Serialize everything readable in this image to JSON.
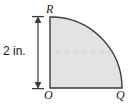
{
  "figure": {
    "type": "quarter-circle-geometry-diagram",
    "shape_name": "quarter circle sector",
    "fill_color": "#e3e3e3",
    "stroke_color": "#3d3d3d",
    "background_color": "#ffffff",
    "dimension": {
      "label": "2 in.",
      "value": 2,
      "unit": "in.",
      "measures": "radius OR (vertical side)",
      "line_color": "#4a4a4a",
      "arrow_style": "double-headed"
    },
    "vertices": [
      {
        "name": "R",
        "label": "R",
        "position": "top-left",
        "description": "top endpoint of vertical radius"
      },
      {
        "name": "O",
        "label": "O",
        "position": "bottom-left",
        "description": "center of the circle / right angle vertex"
      },
      {
        "name": "Q",
        "label": "Q",
        "position": "bottom-right",
        "description": "right endpoint of horizontal radius"
      }
    ],
    "watermark_text": "0 0 0 0 0 0 0"
  }
}
